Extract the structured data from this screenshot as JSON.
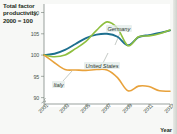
{
  "figure": {
    "title": "Total factor productivity, 2000 = 100",
    "xaxis_title": "Year"
  },
  "chart_data": {
    "type": "line",
    "title": "Total factor productivity, 2000 = 100",
    "xlabel": "Year",
    "ylabel": "Total factor productivity, 2000 = 100",
    "xlim": [
      2001,
      2013
    ],
    "ylim": [
      88.5,
      112
    ],
    "grid": false,
    "legend_position": "inline-annotations",
    "axis_break": true,
    "x_tick_labels": [
      "2001",
      "2003",
      "2005",
      "2007",
      "2009",
      "2011",
      "2013"
    ],
    "y_tick_labels": [
      "90",
      "95",
      "100",
      "105",
      "110"
    ],
    "x": [
      2001,
      2002,
      2003,
      2004,
      2005,
      2006,
      2007,
      2008,
      2009,
      2010,
      2011,
      2012,
      2013
    ],
    "series": [
      {
        "name": "United States",
        "color": "#1d6f8e",
        "values": [
          100.0,
          100.3,
          101.2,
          102.6,
          104.0,
          104.8,
          105.0,
          104.3,
          102.3,
          104.2,
          104.7,
          105.2,
          105.8
        ]
      },
      {
        "name": "Germany",
        "color": "#8fbf3f",
        "values": [
          100.0,
          99.6,
          100.0,
          101.5,
          103.2,
          105.8,
          107.8,
          106.3,
          102.2,
          104.3,
          104.5,
          105.0,
          105.9
        ]
      },
      {
        "name": "Italy",
        "color": "#e8a23c",
        "values": [
          100.0,
          98.2,
          96.6,
          96.5,
          96.4,
          96.6,
          96.5,
          94.7,
          91.6,
          92.7,
          92.6,
          91.6,
          91.5
        ]
      }
    ]
  },
  "annotations": [
    {
      "name": "Germany",
      "text": "Germany"
    },
    {
      "name": "United States",
      "text": "United States"
    },
    {
      "name": "Italy",
      "text": "Italy"
    }
  ]
}
